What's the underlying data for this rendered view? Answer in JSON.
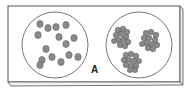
{
  "figure": {
    "label": "A",
    "colors": {
      "outline": "#555555",
      "cell_fill": "#8a8a8a",
      "cell_stroke": "#5a5a5a",
      "background": "#ffffff"
    },
    "left_well": {
      "content": "dispersed cells",
      "cell_count": 15
    },
    "right_well": {
      "content": "agglutinated clumps",
      "clump_count": 3
    }
  }
}
